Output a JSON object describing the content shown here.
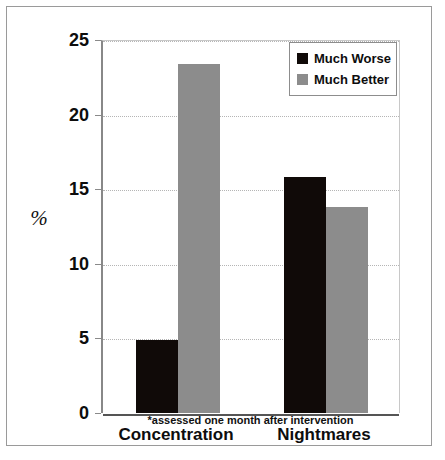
{
  "chart_data": {
    "type": "bar",
    "title": "",
    "subtitle": "",
    "xlabel": "",
    "ylabel": "%",
    "categories": [
      "Concentration",
      "Nightmares"
    ],
    "series": [
      {
        "name": "Much Worse",
        "color": "#100a08",
        "values": [
          4.9,
          15.8
        ]
      },
      {
        "name": "Much Better",
        "color": "#8c8c8c",
        "values": [
          23.4,
          13.8
        ]
      }
    ],
    "ylim": [
      0,
      25
    ],
    "yticks": [
      0,
      5,
      10,
      15,
      20,
      25
    ],
    "ytick_labels": [
      "0",
      "5",
      "10",
      "15",
      "20",
      "25"
    ],
    "grid": true,
    "grid_style": "dotted",
    "legend_position": "top-right",
    "annotations": [
      "*assessed one month after intervention"
    ]
  },
  "figure": {
    "y_axis_title": "%",
    "footnote": "*assessed one month after intervention",
    "caption": "Figure 8.1  Symptom …"
  },
  "legend": {
    "items": [
      {
        "label": "Much Worse",
        "swatch": "black-square-swatch"
      },
      {
        "label": "Much Better",
        "swatch": "gray-square-swatch"
      }
    ]
  },
  "axis": {
    "y_labels": [
      "25",
      "20",
      "15",
      "10",
      "5",
      "0"
    ]
  },
  "categories": {
    "first": "Concentration",
    "second": "Nightmares"
  }
}
